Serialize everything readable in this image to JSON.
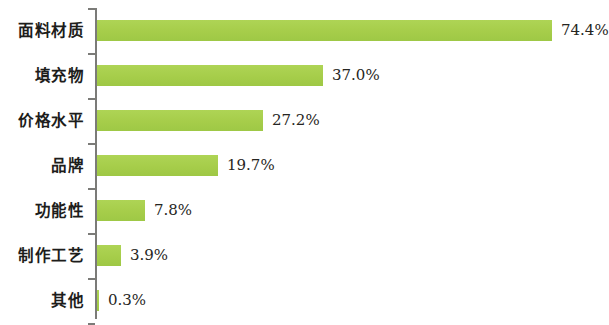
{
  "chart_data": {
    "type": "bar",
    "orientation": "horizontal",
    "title": "",
    "subtitle": "",
    "xlabel": "",
    "ylabel": "",
    "categories": [
      "面料材质",
      "填充物",
      "价格水平",
      "品牌",
      "功能性",
      "制作工艺",
      "其他"
    ],
    "values": [
      74.4,
      37.0,
      27.2,
      19.7,
      7.8,
      3.9,
      0.3
    ],
    "value_labels": [
      "74.4%",
      "37.0%",
      "27.2%",
      "19.7%",
      "7.8%",
      "3.9%",
      "0.3%"
    ],
    "series": [
      {
        "name": "",
        "values": [
          74.4,
          37.0,
          27.2,
          19.7,
          7.8,
          3.9,
          0.3
        ]
      }
    ],
    "xlim": [
      0,
      74.4
    ],
    "unit": "%",
    "grid": false,
    "legend": false,
    "legend_position": "none",
    "bar_color": "#a9d04e",
    "axis_color": "#7b7b78",
    "text_color": "#1d1d1b",
    "background": "#ffffff"
  },
  "layout": {
    "px_per_percent": 6.12,
    "bar_origin_x": 97,
    "row_height": 45,
    "bar_height": 21,
    "plot_top": 8
  },
  "rows": [
    {
      "label": "面料材质",
      "value": 74.4,
      "value_label": "74.4%"
    },
    {
      "label": "填充物",
      "value": 37.0,
      "value_label": "37.0%"
    },
    {
      "label": "价格水平",
      "value": 27.2,
      "value_label": "27.2%"
    },
    {
      "label": "品牌",
      "value": 19.7,
      "value_label": "19.7%"
    },
    {
      "label": "功能性",
      "value": 7.8,
      "value_label": "7.8%"
    },
    {
      "label": "制作工艺",
      "value": 3.9,
      "value_label": "3.9%"
    },
    {
      "label": "其他",
      "value": 0.3,
      "value_label": "0.3%"
    }
  ]
}
